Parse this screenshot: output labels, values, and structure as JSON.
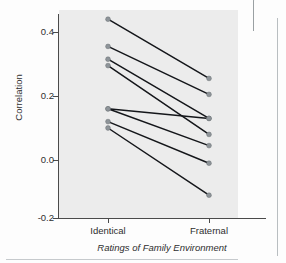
{
  "figure": {
    "caption_axis_title": "Ratings of Family Environment",
    "y_axis_title": "Correlation"
  },
  "chart_data": {
    "type": "line",
    "title": "",
    "subtitle": "",
    "xlabel": "Ratings of Family Environment",
    "ylabel": "Correlation",
    "categories": [
      "Identical",
      "Fraternal"
    ],
    "x_tick_labels": [
      "Identical",
      "Fraternal"
    ],
    "y_tick_labels": [
      "0.4",
      "0.2",
      "0.0",
      "-0.2"
    ],
    "y_ticks": [
      0.4,
      0.2,
      0.0,
      -0.2
    ],
    "ylim": [
      -0.2,
      0.48
    ],
    "grid": false,
    "legend": "none",
    "marker": "filled-circle",
    "series": [
      {
        "name": "pair-1",
        "values": [
          0.44,
          0.255
        ]
      },
      {
        "name": "pair-2",
        "values": [
          0.355,
          0.205
        ]
      },
      {
        "name": "pair-3",
        "values": [
          0.315,
          0.13
        ]
      },
      {
        "name": "pair-4",
        "values": [
          0.295,
          0.08
        ]
      },
      {
        "name": "pair-5",
        "values": [
          0.16,
          0.13
        ]
      },
      {
        "name": "pair-6",
        "values": [
          0.16,
          0.045
        ]
      },
      {
        "name": "pair-7",
        "values": [
          0.12,
          -0.01
        ]
      },
      {
        "name": "pair-8",
        "values": [
          0.1,
          -0.11
        ]
      }
    ],
    "identical_values": [
      0.44,
      0.355,
      0.315,
      0.295,
      0.16,
      0.16,
      0.12,
      0.1
    ],
    "fraternal_values": [
      0.255,
      0.205,
      0.13,
      0.13,
      0.08,
      0.045,
      -0.01,
      -0.11
    ],
    "colors": {
      "line": "#14161a",
      "marker": "#8e9499",
      "panel_background": "#ececec",
      "axis": "#4a4a4a"
    }
  }
}
